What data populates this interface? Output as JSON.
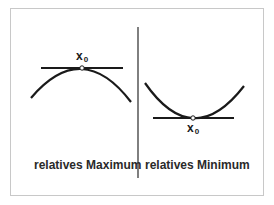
{
  "diagram": {
    "left_panel": {
      "point_label": "x",
      "point_subscript": "0",
      "caption": "relatives Maximum"
    },
    "right_panel": {
      "point_label": "x",
      "point_subscript": "0",
      "caption": "relatives Minimum"
    },
    "colors": {
      "line": "#1a1a1a",
      "frame": "#c8c8c8",
      "background": "#ffffff"
    }
  }
}
